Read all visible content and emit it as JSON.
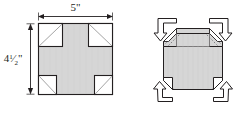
{
  "figure": {
    "background_color": "#ffffff",
    "outline_color": "#231f20",
    "fill_color": "#d6d6d6",
    "cut_fill_color": "#ffffff",
    "fold_line_color": "#6d6e71",
    "arrow_color": "#231f20"
  },
  "left_figure": {
    "name": "flat-net",
    "shape": "rectangle-with-corner-squares-removed",
    "dimensions": {
      "width_label": "5\"",
      "width_value": 5,
      "height_label_whole": "4",
      "height_label_fraction_numerator": "1",
      "height_label_fraction_denominator": "2",
      "height_label_unit": "\"",
      "height_label_full": "4½\"",
      "height_value": 4.5,
      "unit": "inches"
    },
    "corners": [
      {
        "name": "top-left-cut-square",
        "position": "top-left",
        "diagonal": "bottom-left-to-top-right",
        "size": "large"
      },
      {
        "name": "top-right-cut-square",
        "position": "top-right",
        "diagonal": "top-left-to-bottom-right",
        "size": "large"
      },
      {
        "name": "bottom-left-cut-square",
        "position": "bottom-left",
        "diagonal": "top-left-to-bottom-right",
        "size": "small"
      },
      {
        "name": "bottom-right-cut-square",
        "position": "bottom-right",
        "diagonal": "bottom-left-to-top-right",
        "size": "small"
      }
    ]
  },
  "right_figure": {
    "name": "folded-box",
    "shape": "octagonal-box-with-raised-corner-flaps",
    "arrows": [
      {
        "name": "fold-arrow-top-left",
        "position": "top-left",
        "direction": "down-right",
        "style": "hollow-bent-arrow"
      },
      {
        "name": "fold-arrow-top-right",
        "position": "top-right",
        "direction": "down-left",
        "style": "hollow-bent-arrow"
      },
      {
        "name": "fold-arrow-bottom-left",
        "position": "bottom-left",
        "direction": "up-right",
        "style": "hollow-bent-arrow"
      },
      {
        "name": "fold-arrow-bottom-right",
        "position": "bottom-right",
        "direction": "up-left",
        "style": "hollow-bent-arrow"
      }
    ]
  }
}
